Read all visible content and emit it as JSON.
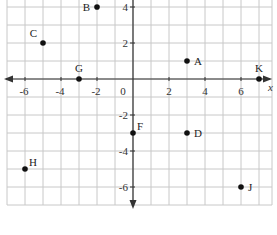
{
  "chart_data": {
    "type": "scatter",
    "title": "",
    "xlabel": "x",
    "ylabel": "",
    "xlim": [
      -7,
      7.5
    ],
    "ylim": [
      -7,
      4.5
    ],
    "grid": true,
    "x_ticks": [
      -6,
      -4,
      -2,
      0,
      2,
      4,
      6
    ],
    "y_ticks": [
      4,
      2,
      -2,
      -4,
      -6
    ],
    "x_tick_labels": [
      "-6",
      "-4",
      "-2",
      "0",
      "2",
      "4",
      "6"
    ],
    "y_tick_labels": [
      "4",
      "2",
      "-2",
      "-4",
      "-6"
    ],
    "points": [
      {
        "label": "A",
        "x": 3,
        "y": 1,
        "label_pos": "right"
      },
      {
        "label": "B",
        "x": -2,
        "y": 4,
        "label_pos": "left"
      },
      {
        "label": "C",
        "x": -5,
        "y": 2,
        "label_pos": "upper-left"
      },
      {
        "label": "D",
        "x": 3,
        "y": -3,
        "label_pos": "right"
      },
      {
        "label": "F",
        "x": 0,
        "y": -3,
        "label_pos": "upper-right"
      },
      {
        "label": "G",
        "x": -3,
        "y": 0,
        "label_pos": "above"
      },
      {
        "label": "H",
        "x": -6,
        "y": -5,
        "label_pos": "upper-right"
      },
      {
        "label": "J",
        "x": 6,
        "y": -6,
        "label_pos": "right"
      },
      {
        "label": "K",
        "x": 7,
        "y": 0,
        "label_pos": "above"
      }
    ]
  },
  "colors": {
    "grid": "#c8c8c8",
    "axis": "#333333",
    "point": "#111111",
    "text": "#333333"
  }
}
